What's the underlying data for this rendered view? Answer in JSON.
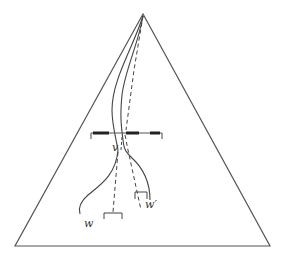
{
  "diagram": {
    "type": "triangle-with-paths",
    "labels": {
      "v": "v",
      "w": "w",
      "w_prime": "w′"
    },
    "colors": {
      "stroke": "#333333",
      "background": "#ffffff"
    },
    "elements": [
      "outer triangle",
      "horizontal dashed bar with end ticks",
      "solid curves from apex",
      "dashed paths from apex",
      "bracket under w",
      "bracket under w′"
    ]
  }
}
